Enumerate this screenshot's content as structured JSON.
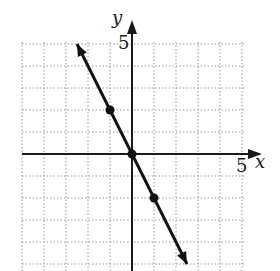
{
  "chart_data": {
    "type": "line",
    "title": "",
    "xlabel": "x",
    "ylabel": "y",
    "xlim": [
      -5,
      5
    ],
    "ylim": [
      -5,
      5
    ],
    "grid": true,
    "tick_labels": {
      "x": [
        "5"
      ],
      "y": [
        "5"
      ]
    },
    "series": [
      {
        "name": "y = -2x",
        "x": [
          -2.5,
          2.5
        ],
        "y": [
          5,
          -5
        ],
        "arrows_both_ends": true,
        "marked_points": [
          {
            "x": -1,
            "y": 2
          },
          {
            "x": 0,
            "y": 0
          },
          {
            "x": 1,
            "y": -2
          }
        ]
      }
    ]
  },
  "labels": {
    "x_axis": "x",
    "y_axis": "y",
    "x_tick": "5",
    "y_tick": "5"
  },
  "colors": {
    "line": "#111111",
    "grid": "#9a9a9a",
    "axis": "#1a1a1a"
  }
}
